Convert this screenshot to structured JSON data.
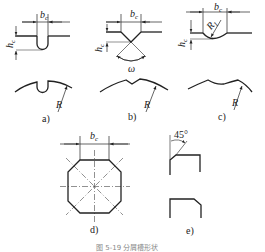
{
  "figure": {
    "caption": "图 5-19  分屑槽形状",
    "panels": [
      {
        "id": "a",
        "label": "a)",
        "groove": "U-shaped (round-bottom) slot",
        "dims": [
          "bc",
          "hc",
          "R"
        ]
      },
      {
        "id": "b",
        "label": "b)",
        "groove": "V-shaped slot",
        "dims": [
          "bc",
          "hc",
          "ω",
          "R"
        ]
      },
      {
        "id": "c",
        "label": "c)",
        "groove": "Arc-bottom slot",
        "dims": [
          "bc",
          "hc",
          "R1",
          "R"
        ]
      },
      {
        "id": "d",
        "label": "d)",
        "groove": "Octagonal cross-section (chamfered square) with center lines",
        "dims": [
          "bc"
        ]
      },
      {
        "id": "e",
        "label": "e)",
        "groove": "45° chamfered edge profiles",
        "dims": [
          "45°"
        ]
      }
    ]
  },
  "labels": {
    "bc": "b",
    "bc_sub": "c",
    "hc": "h",
    "hc_sub": "c",
    "R": "R",
    "R1": "R",
    "R1_sub": "1",
    "omega": "ω",
    "angle45": "45°",
    "a": "a)",
    "b": "b)",
    "c": "c)",
    "d": "d)",
    "e": "e)"
  }
}
